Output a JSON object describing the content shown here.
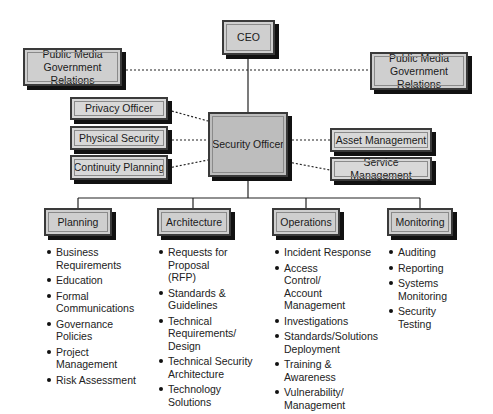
{
  "diagram": {
    "type": "org-chart",
    "top": {
      "label": "CEO"
    },
    "liaisons": [
      {
        "label": "Public Media\nGovernment Relations",
        "line1": "Public Media",
        "line2": "Government Relations",
        "side": "left"
      },
      {
        "label": "Public Media\nGovernment Relations",
        "line1": "Public Media",
        "line2": "Government Relations",
        "side": "right"
      }
    ],
    "center": {
      "label": "Security Officer"
    },
    "left_advisors": [
      {
        "label": "Privacy Officer"
      },
      {
        "label": "Physical Security"
      },
      {
        "label": "Continuity Planning"
      }
    ],
    "right_advisors": [
      {
        "label": "Asset Management"
      },
      {
        "label": "Service Management"
      }
    ],
    "departments": [
      {
        "label": "Planning",
        "items": [
          "Business Requirements",
          "Education",
          "Formal Communications",
          "Governance Policies",
          "Project Management",
          "Risk Assessment"
        ]
      },
      {
        "label": "Architecture",
        "items": [
          "Requests for Proposal (RFP)",
          "Standards & Guidelines",
          "Technical Requirements/ Design",
          "Technical Security Architecture",
          "Technology Solutions"
        ]
      },
      {
        "label": "Operations",
        "items": [
          "Incident Response",
          "Access Control/ Account Management",
          "Investigations",
          "Standards/Solutions Deployment",
          "Training & Awareness",
          "Vulnerability/ Management"
        ]
      },
      {
        "label": "Monitoring",
        "items": [
          "Auditing",
          "Reporting",
          "Systems Monitoring",
          "Security Testing"
        ]
      }
    ],
    "colors": {
      "box_fill": "#cfcfcf",
      "shadow": "#111111",
      "line": "#222222"
    }
  }
}
